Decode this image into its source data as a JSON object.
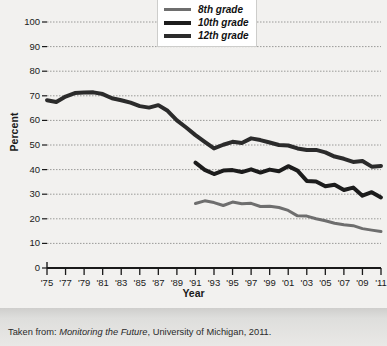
{
  "chart_data": {
    "type": "line",
    "title": "",
    "xlabel": "Year",
    "ylabel": "Percent",
    "ylim": [
      0,
      100
    ],
    "ytick_values": [
      0,
      10,
      20,
      30,
      40,
      50,
      60,
      70,
      80,
      90,
      100
    ],
    "ytick_labels": [
      "0",
      "10",
      "20",
      "30",
      "40",
      "50",
      "60",
      "70",
      "80",
      "90",
      "100"
    ],
    "xlim": [
      1975,
      2011
    ],
    "xtick_values": [
      1975,
      1977,
      1979,
      1981,
      1983,
      1985,
      1987,
      1989,
      1991,
      1993,
      1995,
      1997,
      1999,
      2001,
      2003,
      2005,
      2007,
      2009,
      2011
    ],
    "xtick_labels": [
      "'75",
      "'77",
      "'79",
      "'81",
      "'83",
      "'85",
      "'87",
      "'89",
      "'91",
      "'93",
      "'95",
      "'97",
      "'99",
      "'01",
      "'03",
      "'05",
      "'07",
      "'09",
      "'11"
    ],
    "grid": true,
    "grid_axis": "y",
    "legend_position": "top-center",
    "series": [
      {
        "name": "8th grade",
        "color": "#6e6e6e",
        "linewidth": 3,
        "x": [
          1991,
          1992,
          1993,
          1994,
          1995,
          1996,
          1997,
          1998,
          1999,
          2000,
          2001,
          2002,
          2003,
          2004,
          2005,
          2006,
          2007,
          2008,
          2009,
          2010,
          2011
        ],
        "values": [
          26.2,
          27.3,
          26.6,
          25.4,
          26.8,
          26.1,
          26.3,
          25.0,
          25.1,
          24.6,
          23.4,
          21.2,
          21.1,
          20.0,
          19.2,
          18.2,
          17.6,
          17.2,
          16.0,
          15.4,
          14.8
        ]
      },
      {
        "name": "10th grade",
        "color": "#1c1c1c",
        "linewidth": 4,
        "x": [
          1991,
          1992,
          1993,
          1994,
          1995,
          1996,
          1997,
          1998,
          1999,
          2000,
          2001,
          2002,
          2003,
          2004,
          2005,
          2006,
          2007,
          2008,
          2009,
          2010,
          2011
        ],
        "values": [
          42.8,
          39.9,
          38.2,
          39.6,
          39.8,
          39.0,
          40.1,
          38.8,
          40.0,
          39.3,
          41.4,
          39.6,
          35.4,
          35.2,
          33.2,
          33.8,
          31.7,
          32.7,
          29.4,
          30.8,
          28.7
        ]
      },
      {
        "name": "12th grade",
        "color": "#2b2b2b",
        "linewidth": 4,
        "x": [
          1975,
          1976,
          1977,
          1978,
          1979,
          1980,
          1981,
          1982,
          1983,
          1984,
          1985,
          1986,
          1987,
          1988,
          1989,
          1990,
          1991,
          1992,
          1993,
          1994,
          1995,
          1996,
          1997,
          1998,
          1999,
          2000,
          2001,
          2002,
          2003,
          2004,
          2005,
          2006,
          2007,
          2008,
          2009,
          2010,
          2011
        ],
        "values": [
          68.2,
          67.5,
          69.7,
          71.1,
          71.3,
          71.4,
          70.7,
          69.0,
          68.2,
          67.2,
          65.8,
          65.2,
          66.2,
          63.9,
          60.0,
          57.1,
          54.0,
          51.3,
          48.6,
          50.1,
          51.3,
          50.8,
          52.7,
          52.0,
          51.0,
          50.0,
          49.8,
          48.6,
          48.0,
          48.0,
          47.0,
          45.3,
          44.4,
          43.1,
          43.5,
          41.2,
          41.5
        ]
      }
    ]
  },
  "footer": {
    "prefix": "Taken from: ",
    "source_title": "Monitoring the Future",
    "suffix": ", University of Michigan, 2011."
  }
}
